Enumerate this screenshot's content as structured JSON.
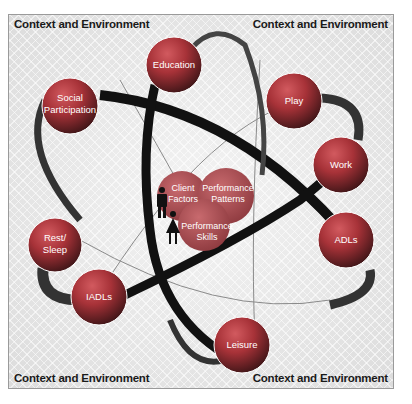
{
  "corners": {
    "top_left": "Context and Environment",
    "top_right": "Context and Environment",
    "bottom_left": "Context and Environment",
    "bottom_right": "Context and Environment"
  },
  "occupations": [
    {
      "id": "education",
      "label": "Education"
    },
    {
      "id": "social-participation",
      "label1": "Social",
      "label2": "Participation"
    },
    {
      "id": "play",
      "label": "Play"
    },
    {
      "id": "work",
      "label": "Work"
    },
    {
      "id": "adls",
      "label": "ADLs"
    },
    {
      "id": "rest-sleep",
      "label1": "Rest/",
      "label2": "Sleep"
    },
    {
      "id": "iadls",
      "label": "IADLs"
    },
    {
      "id": "leisure",
      "label": "Leisure"
    }
  ],
  "core": {
    "client_factors": {
      "line1": "Client",
      "line2": "Factors"
    },
    "performance_patterns": {
      "line1": "Performance",
      "line2": "Patterns"
    },
    "performance_skills": {
      "line1": "Performance",
      "line2": "Skills"
    }
  },
  "icons": [
    "male-person-icon",
    "female-person-icon"
  ],
  "colors": {
    "sphere_red": "#b9393f",
    "sphere_dark": "#5a2226",
    "core_red": "#a8464b",
    "orbit_black": "#111111",
    "background": "#e6e6e6",
    "text_white": "#ffffff"
  }
}
